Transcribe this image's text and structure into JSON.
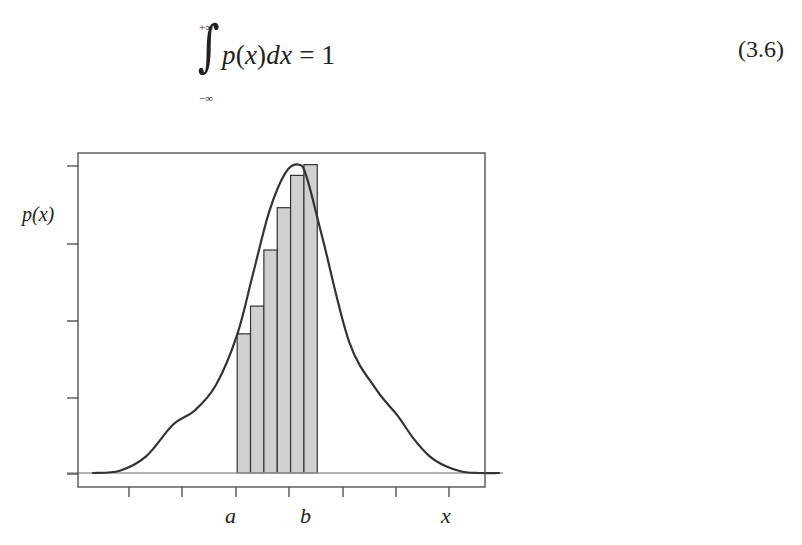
{
  "equation": {
    "integral_upper_limit": "+∞",
    "integral_lower_limit": "−∞",
    "integrand_p": "p",
    "integrand_open": "(",
    "integrand_x": "x",
    "integrand_close": ")",
    "differential": "dx",
    "equals": " = ",
    "rhs": "1",
    "number": "(3.6)"
  },
  "figure": {
    "y_axis_label": "p(x)",
    "x_labels": [
      {
        "text": "a",
        "x": 231
      },
      {
        "text": "b",
        "x": 306
      },
      {
        "text": "x",
        "x": 447
      }
    ]
  },
  "chart_data": {
    "type": "area",
    "title": "",
    "xlabel": "x",
    "ylabel": "p(x)",
    "x_tick_labels": [
      "",
      "",
      "a",
      "",
      "b",
      "",
      "",
      "x"
    ],
    "x_tick_count": 7,
    "y_tick_count": 5,
    "y_tick_labels": [],
    "grid": false,
    "legend": null,
    "annotations": [
      "a",
      "b",
      "x"
    ],
    "curve": {
      "name": "p(x)",
      "x": [
        0.0,
        0.5,
        1.0,
        1.5,
        1.9,
        2.3,
        2.7,
        3.0,
        3.3,
        3.6,
        3.85,
        4.0,
        4.3,
        4.8,
        5.3,
        5.7,
        6.0,
        6.3,
        6.6,
        6.9,
        7.2,
        7.6
      ],
      "y": [
        0.0,
        0.03,
        0.22,
        0.63,
        0.81,
        1.14,
        1.8,
        2.6,
        3.4,
        3.9,
        4.01,
        3.85,
        3.05,
        1.7,
        1.09,
        0.75,
        0.45,
        0.22,
        0.09,
        0.02,
        0.0,
        0.0
      ]
    },
    "bars": {
      "name": "rectangles between a and b",
      "x_start": [
        2.7,
        2.95,
        3.2,
        3.45,
        3.7,
        3.95
      ],
      "width": 0.25,
      "values": [
        1.81,
        2.17,
        2.9,
        3.45,
        3.87,
        4.01
      ],
      "fill": "#d0d0d0",
      "edge": "#333333"
    },
    "ylim": [
      0,
      4.2
    ],
    "xlim": [
      -0.3,
      7.7
    ],
    "colors": {
      "curve": "#333333",
      "bar_fill": "#d0d0d0",
      "baseline": "#9a9a9a",
      "frame": "#555555"
    }
  }
}
